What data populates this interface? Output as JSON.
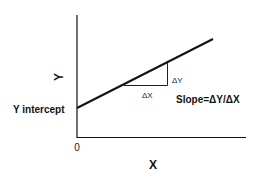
{
  "diagram": {
    "type": "linear-function-graph",
    "axes": {
      "x_label": "X",
      "y_label": "Y",
      "origin_label": "0"
    },
    "line": {
      "start": [
        77,
        108
      ],
      "end": [
        213,
        39
      ]
    },
    "annotations": {
      "y_intercept_label": "Y intercept",
      "delta_x_label": "ΔX",
      "delta_y_label": "ΔY",
      "slope_formula": "Slope=ΔY/ΔX"
    },
    "colors": {
      "stroke": "#111111",
      "background": "#ffffff"
    }
  }
}
